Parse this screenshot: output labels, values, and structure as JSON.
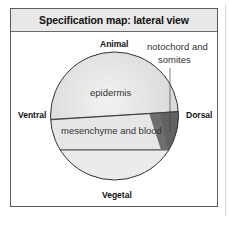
{
  "figure": {
    "title": "Specification map: lateral view",
    "axes": {
      "top": "Animal",
      "bottom": "Vegetal",
      "left": "Ventral",
      "right": "Dorsal"
    },
    "regions": [
      {
        "name": "epidermis",
        "label": "epidermis",
        "color": "#dcdcdc"
      },
      {
        "name": "mesenchyme",
        "label": "mesenchyme and blood",
        "color": "#e4e4e4"
      },
      {
        "name": "notochord",
        "label": "notochord and somites",
        "color": "#6e6e6e"
      },
      {
        "name": "vegetal-region",
        "label": "",
        "color": "#ececec"
      }
    ],
    "callout": {
      "line1": "notochord and",
      "line2": "somites"
    },
    "colors": {
      "border": "#5a5a5a",
      "header_bg": "#e8e8e8",
      "outline": "#333333"
    }
  }
}
